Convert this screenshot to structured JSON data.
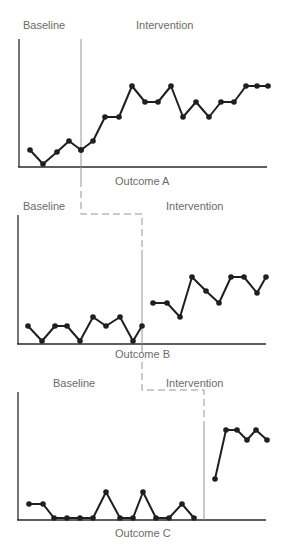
{
  "figure": {
    "type": "multiple-baseline single-subject design",
    "colors": {
      "data_line": "#1f1f1f",
      "axis": "#2a2a2a",
      "phase_line": "#8a8a8a",
      "label_text": "#6b6b6b"
    }
  },
  "chart_data": [
    {
      "type": "line",
      "title": "Outcome A",
      "xlabel": "Outcome A",
      "ylabel": "",
      "phases": [
        "Baseline",
        "Intervention"
      ],
      "grid": false,
      "phase_change_after_session": 5,
      "sessions": [
        1,
        2,
        3,
        4,
        5,
        6,
        7,
        8,
        9,
        10,
        11,
        12,
        13,
        14,
        15,
        16,
        17,
        18,
        19,
        20
      ],
      "values": [
        2,
        0,
        2,
        3,
        2,
        3,
        5,
        5,
        7,
        6,
        6,
        7,
        5,
        6,
        5,
        6,
        6,
        7,
        7,
        7
      ],
      "series": [
        {
          "name": "Baseline",
          "x": [
            1,
            2,
            3,
            4,
            5
          ],
          "values": [
            2,
            0,
            2,
            3,
            2
          ]
        },
        {
          "name": "Intervention",
          "x": [
            6,
            7,
            8,
            9,
            10,
            11,
            12,
            13,
            14,
            15,
            16,
            17,
            18,
            19,
            20
          ],
          "values": [
            3,
            5,
            5,
            7,
            6,
            6,
            7,
            5,
            6,
            5,
            6,
            6,
            7,
            7,
            7
          ]
        }
      ],
      "connected_across_phase": true
    },
    {
      "type": "line",
      "title": "Outcome B",
      "xlabel": "Outcome B",
      "ylabel": "",
      "phases": [
        "Baseline",
        "Intervention"
      ],
      "grid": false,
      "phase_change_after_session": 10,
      "sessions": [
        1,
        2,
        3,
        4,
        5,
        6,
        7,
        8,
        9,
        10,
        11,
        12,
        13,
        14,
        15,
        16,
        17,
        18,
        19,
        20
      ],
      "values": [
        1,
        0,
        1,
        1,
        0,
        1.6,
        1,
        1.6,
        0,
        1,
        2.6,
        2.6,
        1.6,
        4.6,
        3.6,
        2.6,
        4.6,
        4.6,
        3.5,
        4.6
      ],
      "series": [
        {
          "name": "Baseline",
          "x": [
            1,
            2,
            3,
            4,
            5,
            6,
            7,
            8,
            9,
            10
          ],
          "values": [
            1,
            0,
            1,
            1,
            0,
            1.6,
            1,
            1.6,
            0,
            1
          ]
        },
        {
          "name": "Intervention",
          "x": [
            11,
            12,
            13,
            14,
            15,
            16,
            17,
            18,
            19,
            20
          ],
          "values": [
            2.6,
            2.6,
            1.6,
            4.6,
            3.6,
            2.6,
            4.6,
            4.6,
            3.5,
            4.6
          ]
        }
      ],
      "connected_across_phase": false
    },
    {
      "type": "line",
      "title": "Outcome C",
      "xlabel": "Outcome C",
      "ylabel": "",
      "phases": [
        "Baseline",
        "Intervention"
      ],
      "grid": false,
      "phase_change_after_session": 14,
      "sessions": [
        1,
        2,
        3,
        4,
        5,
        6,
        7,
        8,
        9,
        10,
        11,
        12,
        13,
        14,
        15,
        16,
        17,
        18,
        19,
        20
      ],
      "values": [
        1,
        1,
        0,
        0,
        0,
        0,
        2,
        0,
        0,
        2,
        0,
        0,
        1,
        0,
        3,
        6.5,
        6.5,
        5.8,
        6.5,
        5.8
      ],
      "series": [
        {
          "name": "Baseline",
          "x": [
            1,
            2,
            3,
            4,
            5,
            6,
            7,
            8,
            9,
            10,
            11,
            12,
            13,
            14
          ],
          "values": [
            1,
            1,
            0,
            0,
            0,
            0,
            2,
            0,
            0,
            2,
            0,
            0,
            1,
            0
          ]
        },
        {
          "name": "Intervention",
          "x": [
            15,
            16,
            17,
            18,
            19,
            20
          ],
          "values": [
            3,
            6.5,
            6.5,
            5.8,
            6.5,
            5.8
          ]
        }
      ],
      "connected_across_phase": false
    }
  ],
  "panels": [
    {
      "baseline_label": "Baseline",
      "intervention_label": "Intervention",
      "outcome_label": "Outcome A",
      "baseline_pts": "30,150 43,164 57,152 69,141 81,150",
      "intervention_pts": "81,150 93,141 105,117 119,117 132,86 145,102 158,102 171,86 183,117 196,102 209,117 221,102 234,102 246,86 257,86 268,86"
    },
    {
      "baseline_label": "Baseline",
      "intervention_label": "Intervention",
      "outcome_label": "Outcome B",
      "baseline_pts": "28,326 42,341 55,326 67,326 80,341 93,317 106,326 120,317 133,341 142,326",
      "intervention_pts": "153,303 167,303 180,317 192,277 206,291 219,303 231,277 244,277 257,293 266,277"
    },
    {
      "baseline_label": "Baseline",
      "intervention_label": "Intervention",
      "outcome_label": "Outcome C",
      "baseline_pts": "29,504 43,504 54,518 67,518 80,518 93,518 106,492 120,518 133,518 143,492 156,518 169,518 182,504 194,518",
      "intervention_pts": "215,479 226,430 237,430 247,440 256,430 267,440"
    }
  ]
}
